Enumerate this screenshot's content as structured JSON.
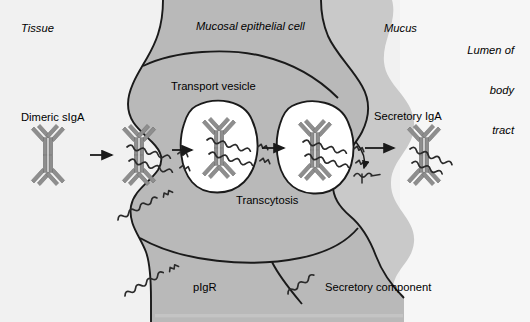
{
  "figure": {
    "width": 530,
    "height": 322
  },
  "regions": {
    "tissue": {
      "label": "Tissue",
      "color": "#f0f0f0"
    },
    "epithelial_cell": {
      "label": "Mucosal epithelial cell",
      "color": "#b9b9b9"
    },
    "mucus": {
      "label": "Mucus",
      "color": "#c9c9c9"
    },
    "lumen": {
      "label_line1": "Lumen of",
      "label_line2": "body",
      "label_line3": "tract",
      "color": "#f4f4f4"
    },
    "vesicle_fill": "#ffffff",
    "outline": "#1a1a1a"
  },
  "labels": {
    "tissue": "Tissue",
    "mucosal_epithelial_cell": "Mucosal epithelial cell",
    "mucus": "Mucus",
    "lumen_of": "Lumen of",
    "lumen_body": "body",
    "lumen_tract": "tract",
    "dimeric_siga": "Dimeric sIgA",
    "transport_vesicle": "Transport vesicle",
    "transcytosis": "Transcytosis",
    "secretory_iga": "Secretory IgA",
    "pigr": "pIgR",
    "secretory_component": "Secretory component"
  },
  "legend": [
    {
      "key": "pigr",
      "label": "pIgR",
      "glyph": "long-coil-with-tail"
    },
    {
      "key": "secretory-component",
      "label": "Secretory component",
      "glyph": "short-coil"
    }
  ],
  "molecules": {
    "antibody_color": "#8e8e8e",
    "antibody_outline": "#6e6e6e",
    "receptor_color": "#2a2a2a",
    "steps": [
      {
        "id": "free-dimeric-siga",
        "label": "Dimeric sIgA",
        "bound_receptor": false
      },
      {
        "id": "receptor-bound-siga",
        "label": "",
        "bound_receptor": true
      },
      {
        "id": "vesicle-1-siga",
        "label": "Transport vesicle",
        "bound_receptor": true
      },
      {
        "id": "vesicle-2-siga",
        "label": "Transcytosis",
        "bound_receptor": true
      },
      {
        "id": "secreted-siga",
        "label": "Secretory IgA",
        "bound_receptor": true
      }
    ]
  },
  "arrows": [
    {
      "id": "arrow-1",
      "from": "free-dimeric-siga",
      "to": "receptor-bound-siga"
    },
    {
      "id": "arrow-2",
      "from": "receptor-bound-siga",
      "to": "vesicle-1-siga"
    },
    {
      "id": "arrow-3",
      "from": "vesicle-1-siga",
      "to": "vesicle-2-siga"
    },
    {
      "id": "arrow-4",
      "from": "vesicle-2-siga",
      "to": "secreted-siga"
    },
    {
      "id": "arrow-cleavage",
      "from": "vesicle-2-siga",
      "to": "cleaved-fragment",
      "curved": true
    }
  ]
}
